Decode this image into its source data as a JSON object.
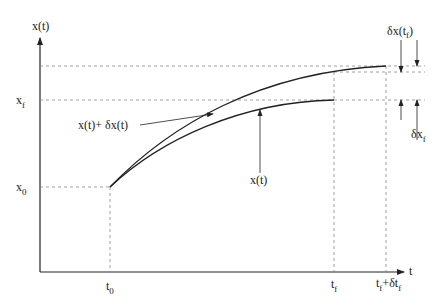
{
  "diagram": {
    "type": "variation-of-trajectory-with-free-endpoint",
    "axes": {
      "y_label": "x(t)",
      "x_label": "t"
    },
    "y_ticks": {
      "x0": {
        "base": "x",
        "sub": "0"
      },
      "xf": {
        "base": "x",
        "sub": "f"
      }
    },
    "x_ticks": {
      "t0": {
        "base": "t",
        "sub": "0"
      },
      "tf": {
        "base": "t",
        "sub": "f"
      },
      "tf_dtf": {
        "base": "t",
        "sub": "f",
        "plus": "+",
        "delta": "δt",
        "sub2": "f"
      }
    },
    "curves": [
      {
        "name": "x(t)",
        "label": "x(t)"
      },
      {
        "name": "x(t)+δx(t)",
        "label": "x(t)+ δx(t)"
      }
    ],
    "annotations": {
      "dx_tf": {
        "base": "δx(t",
        "sub": "f",
        "close": ")"
      },
      "dxf": {
        "base": "δx",
        "sub": "f"
      }
    },
    "colors": {
      "line": "#222222",
      "dash": "#888888"
    }
  }
}
